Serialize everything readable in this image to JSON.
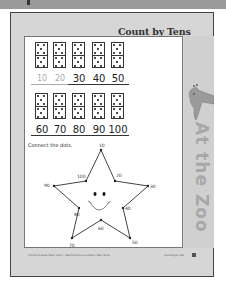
{
  "worksheet": {
    "title": "Count by Tens",
    "side_label": "At the Zoo",
    "side_illustration": "giraffe-icon",
    "dominoes": {
      "dots_per_half": 5,
      "row1": [
        {
          "label": "10",
          "style": "traced"
        },
        {
          "label": "20",
          "style": "traced"
        },
        {
          "label": "30",
          "style": "solid"
        },
        {
          "label": "40",
          "style": "solid"
        },
        {
          "label": "50",
          "style": "solid"
        }
      ],
      "row2": [
        {
          "label": "60",
          "style": "solid"
        },
        {
          "label": "70",
          "style": "solid"
        },
        {
          "label": "80",
          "style": "solid"
        },
        {
          "label": "90",
          "style": "solid"
        },
        {
          "label": "100",
          "style": "solid"
        }
      ]
    },
    "instruction": "Connect the dots.",
    "star_points": [
      "10",
      "20",
      "30",
      "40",
      "50",
      "60",
      "70",
      "80",
      "90",
      "100"
    ],
    "footer": {
      "left": "©2002 by Evan-Moor Corp. • Math Practice at Home • EMC 4016",
      "right": "Counting by Ten"
    }
  },
  "colors": {
    "page_background": "#d6d6d6",
    "panel_background": "#ffffff",
    "top_bar": "#9a9a9a",
    "side_text": "#a8a8a8",
    "traced_number": "#aaaaaa"
  }
}
